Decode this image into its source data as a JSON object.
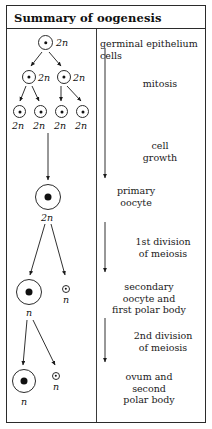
{
  "title": "Summary of oogenesis",
  "colors": {
    "border": "#2b2b2b",
    "text": "#1a1a1a",
    "nucleus": "#111111",
    "background": "#ffffff"
  },
  "diagram": {
    "ploidy_diploid": "2n",
    "ploidy_haploid": "n",
    "cells": [
      {
        "id": "germinal-cell-1",
        "label": "2n",
        "stage": "germinal epithelium"
      },
      {
        "id": "germinal-cell-2",
        "label": "2n",
        "stage": "after first mitosis"
      },
      {
        "id": "germinal-cell-3",
        "label": "2n",
        "stage": "after first mitosis"
      },
      {
        "id": "germinal-cell-4",
        "label": "2n",
        "stage": "after second mitosis"
      },
      {
        "id": "germinal-cell-5",
        "label": "2n",
        "stage": "after second mitosis"
      },
      {
        "id": "germinal-cell-6",
        "label": "2n",
        "stage": "after second mitosis"
      },
      {
        "id": "germinal-cell-7",
        "label": "2n",
        "stage": "after second mitosis"
      },
      {
        "id": "primary-oocyte",
        "label": "2n",
        "stage": "primary oocyte"
      },
      {
        "id": "secondary-oocyte",
        "label": "n",
        "stage": "secondary oocyte"
      },
      {
        "id": "first-polar-body",
        "label": "n",
        "stage": "first polar body"
      },
      {
        "id": "ovum",
        "label": "n",
        "stage": "ovum"
      },
      {
        "id": "second-polar-body",
        "label": "n",
        "stage": "second polar body"
      }
    ]
  },
  "annotations": {
    "germinal": "germinal epithelium cells",
    "mitosis": "mitosis",
    "growth": "cell\ngrowth",
    "primary_oocyte": "primary\noocyte",
    "first_meiosis": "1st division\nof meiosis",
    "secondary": "secondary\noocyte and\nfirst polar body",
    "second_meiosis": "2nd division\nof meiosis",
    "ovum": "ovum and\nsecond\npolar body"
  }
}
